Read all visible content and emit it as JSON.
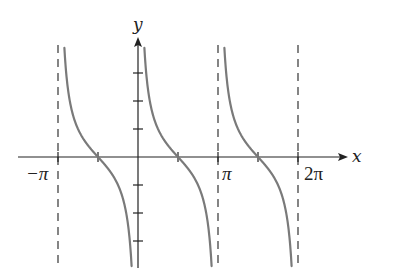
{
  "chart_data": {
    "type": "line",
    "title": "",
    "function": "y = cot x",
    "xlabel": "x",
    "ylabel": "y",
    "xlim": [
      -3.64,
      6.62
    ],
    "ylim": [
      -4.0,
      4.1
    ],
    "x_tick_labels": [
      {
        "value": -3.14159,
        "label": "−π"
      },
      {
        "value": 3.14159,
        "label": "π"
      },
      {
        "value": 6.28319,
        "label": "2π"
      }
    ],
    "x_ticks_unlabeled": [
      -1.5708,
      1.5708,
      4.7124
    ],
    "y_ticks": [
      -3,
      -2,
      -1,
      1,
      2,
      3
    ],
    "asymptotes": [
      -3.14159,
      3.14159,
      6.28319
    ],
    "asymptote_style": "dashed",
    "zeros": [
      -1.5708,
      1.5708,
      4.7124
    ],
    "series": [
      {
        "name": "cot x branch 1",
        "domain": [
          -3.14159,
          0
        ],
        "y_range_visible": [
          -3.9,
          3.9
        ]
      },
      {
        "name": "cot x branch 2",
        "domain": [
          0,
          3.14159
        ],
        "y_range_visible": [
          -3.9,
          3.9
        ]
      },
      {
        "name": "cot x branch 3",
        "domain": [
          3.14159,
          6.28319
        ],
        "y_range_visible": [
          -3.9,
          3.9
        ]
      }
    ],
    "grid": false,
    "legend": null
  },
  "labels": {
    "x_axis": "x",
    "y_axis": "y",
    "neg_pi": "−π",
    "pi": "π",
    "two_pi": "2π"
  },
  "colors": {
    "curve": "#7a7a7a",
    "axis": "#222222",
    "asymptote": "#444444"
  }
}
